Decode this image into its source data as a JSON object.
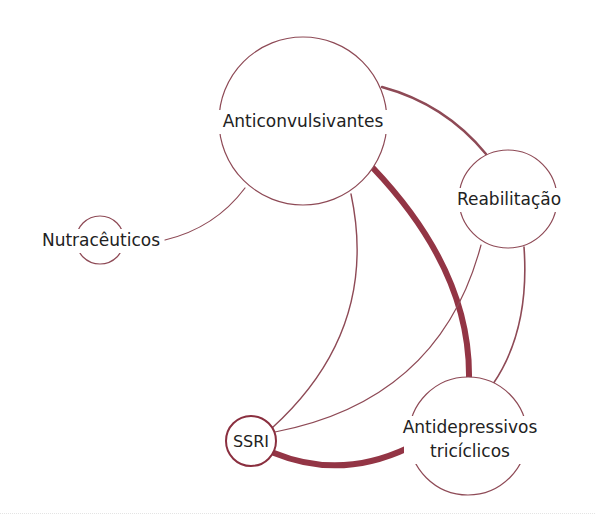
{
  "diagram": {
    "type": "network-graph",
    "colors": {
      "edge": "#8e4a56",
      "edge_strong": "#933545",
      "node_stroke": "#8e4a56",
      "text": "#222222",
      "background": "#ffffff"
    },
    "nodes": [
      {
        "id": "anticonvulsivantes",
        "label": "Anticonvulsivantes",
        "cx": 303,
        "cy": 121,
        "r": 84
      },
      {
        "id": "reabilitacao",
        "label": "Reabilitação",
        "cx": 508,
        "cy": 199,
        "r": 49
      },
      {
        "id": "nutraceuticos",
        "label": "Nutracêuticos",
        "cx": 100,
        "cy": 240,
        "r": 24
      },
      {
        "id": "antidepressivos",
        "label_line1": "Antidepressivos",
        "label_line2": "tricíclicos",
        "cx": 468,
        "cy": 436,
        "r": 59
      },
      {
        "id": "ssri",
        "label": "SSRI",
        "cx": 251,
        "cy": 441,
        "r": 25
      }
    ],
    "edges": [
      {
        "from": "anticonvulsivantes",
        "to": "reabilitacao",
        "weight": "medium"
      },
      {
        "from": "anticonvulsivantes",
        "to": "antidepressivos",
        "weight": "strong"
      },
      {
        "from": "anticonvulsivantes",
        "to": "nutraceuticos",
        "weight": "thin"
      },
      {
        "from": "anticonvulsivantes",
        "to": "ssri",
        "weight": "thin"
      },
      {
        "from": "reabilitacao",
        "to": "ssri",
        "weight": "thin"
      },
      {
        "from": "reabilitacao",
        "to": "antidepressivos",
        "weight": "thin"
      },
      {
        "from": "ssri",
        "to": "antidepressivos",
        "weight": "strong"
      }
    ]
  }
}
